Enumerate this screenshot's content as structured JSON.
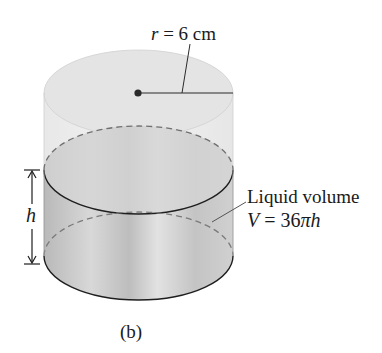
{
  "figure": {
    "caption": "(b)",
    "radius_label": {
      "var": "r",
      "eq": " = 6 cm"
    },
    "height_label": "h",
    "liquid_label": {
      "line1": "Liquid volume",
      "line2_var": "V",
      "line2_eq": " = 36",
      "line2_pi": "π",
      "line2_h": "h"
    },
    "colors": {
      "stroke": "#1e1e1e",
      "dashed": "#7a7a7a",
      "empty_fill": "#ececec",
      "liquid_fill": "#c9c9c9"
    }
  }
}
